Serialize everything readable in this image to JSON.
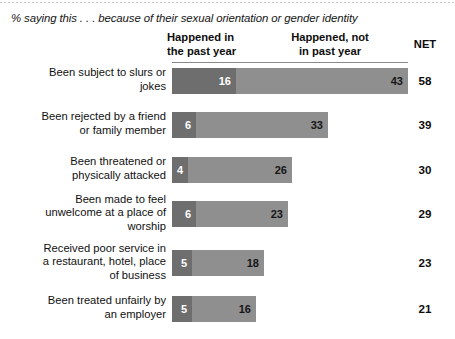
{
  "subtitle": "% saying this . . . because of their sexual orientation or gender identity",
  "columns": {
    "happened": "Happened in\nthe past year",
    "happened_line1": "Happened in",
    "happened_line2": "the past year",
    "not_line1": "Happened, not",
    "not_line2": "in past year",
    "net": "NET"
  },
  "colors": {
    "segment_past_year": "#6e6e6e",
    "segment_not_past_year": "#8f8f8f",
    "background": "#ffffff",
    "text": "#101010"
  },
  "chart_data": {
    "type": "bar",
    "title": "% saying this . . . because of their sexual orientation or gender identity",
    "xlabel": "",
    "ylabel": "",
    "orientation": "horizontal",
    "stacked": true,
    "grid": false,
    "legend_position": "top",
    "xlim": [
      0,
      60
    ],
    "categories": [
      "Been subject to slurs or jokes",
      "Been rejected by a friend or family member",
      "Been threatened or physically attacked",
      "Been made to feel unwelcome at a place of worship",
      "Received poor service in a restaurant, hotel, place of business",
      "Been treated unfairly by an employer"
    ],
    "series": [
      {
        "name": "Happened in the past year",
        "values": [
          16,
          6,
          4,
          6,
          5,
          5
        ]
      },
      {
        "name": "Happened, not in past year",
        "values": [
          43,
          33,
          26,
          23,
          18,
          16
        ]
      }
    ],
    "net": [
      58,
      39,
      30,
      29,
      23,
      21
    ]
  },
  "rows": [
    {
      "label_lines": [
        "Been subject to slurs or",
        "jokes"
      ],
      "past_year": 16,
      "not_past_year": 43,
      "net": 58
    },
    {
      "label_lines": [
        "Been rejected by a friend",
        "or family member"
      ],
      "past_year": 6,
      "not_past_year": 33,
      "net": 39
    },
    {
      "label_lines": [
        "Been threatened or",
        "physically attacked"
      ],
      "past_year": 4,
      "not_past_year": 26,
      "net": 30
    },
    {
      "label_lines": [
        "Been made to feel",
        "unwelcome at a place of",
        "worship"
      ],
      "past_year": 6,
      "not_past_year": 23,
      "net": 29
    },
    {
      "label_lines": [
        "Received poor service in",
        "a restaurant, hotel, place",
        "of business"
      ],
      "past_year": 5,
      "not_past_year": 18,
      "net": 23
    },
    {
      "label_lines": [
        "Been treated unfairly by",
        "an employer"
      ],
      "past_year": 5,
      "not_past_year": 16,
      "net": 21
    }
  ]
}
